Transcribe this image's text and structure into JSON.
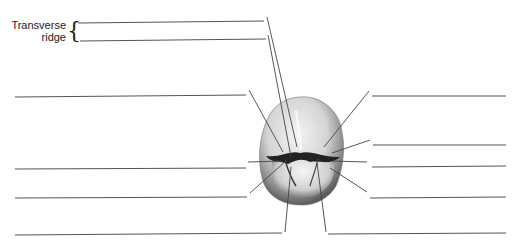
{
  "diagram": {
    "labels": [
      {
        "id": "transverse-ridge",
        "text_line1": "Transverse",
        "text_line2": "ridge"
      }
    ],
    "blank_answer_lines_count": 11,
    "colors": {
      "line": "#555555",
      "text": "#222222",
      "tooth_light": "#e8e8e8",
      "tooth_dark": "#2a2a2a"
    }
  }
}
